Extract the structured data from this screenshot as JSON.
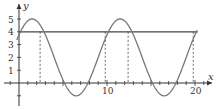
{
  "chart_data": {
    "type": "line",
    "title": "",
    "xlabel": "x",
    "ylabel": "y",
    "xlim": [
      -1.5,
      21.5
    ],
    "ylim": [
      -1.8,
      5.8
    ],
    "x_ticks_labeled": [
      "10",
      "20"
    ],
    "y_ticks_labeled": [
      "1",
      "2",
      "3",
      "4",
      "5"
    ],
    "x_minor_tick_step": 1,
    "grid": false,
    "legend": null,
    "series": [
      {
        "name": "curve",
        "description": "sinusoid y = 2 + 3*sin(2*pi*(x+1)/10)",
        "x": [
          0,
          1.5,
          4,
          6.5,
          9,
          11.5,
          14,
          16.5,
          19,
          20
        ],
        "values": [
          4.6,
          5.0,
          2.9,
          -1.0,
          2.0,
          5.0,
          2.9,
          -1.0,
          3.8,
          4.6
        ]
      },
      {
        "name": "horizontal line",
        "description": "y = 4",
        "x": [
          0,
          20.3
        ],
        "values": [
          4,
          4
        ]
      }
    ],
    "annotations": [
      {
        "type": "dashed-vertical",
        "x": 2.4,
        "from_y": 0,
        "to_y": 4
      },
      {
        "type": "dashed-vertical",
        "x": 9.8,
        "from_y": 0,
        "to_y": 4
      },
      {
        "type": "dashed-vertical",
        "x": 12.4,
        "from_y": 0,
        "to_y": 4
      },
      {
        "type": "dashed-vertical",
        "x": 19.8,
        "from_y": 0,
        "to_y": 4
      }
    ],
    "colors": {
      "axes": "#333333",
      "curve": "#777777",
      "line": "#444444",
      "dashes": "#444444"
    }
  }
}
